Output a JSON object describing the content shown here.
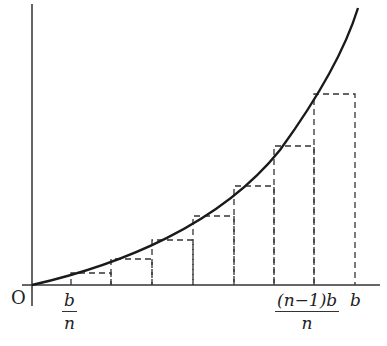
{
  "diagram": {
    "origin_label": "O",
    "x_tick_labels": [
      {
        "num": "b",
        "den": "n"
      },
      {
        "num": "(n−1)b",
        "den": "n"
      },
      {
        "plain": "b"
      }
    ],
    "partition_count": 8,
    "colors": {
      "curve": "#1a1a1a",
      "axes": "#333333",
      "dashed": "#333333"
    }
  }
}
